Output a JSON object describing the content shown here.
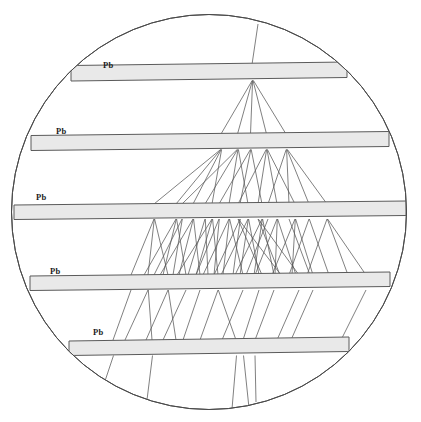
{
  "figure": {
    "kind": "cloud-chamber-cascade-shower",
    "background_color": "#ffffff"
  },
  "chamber": {
    "shape": "circle",
    "center_x": 209,
    "center_y": 212,
    "radius": 197.5,
    "outline_color": "#4a4a4a",
    "outline_width": 1.0,
    "fill_color": "#ffffff"
  },
  "style": {
    "plate_fill": "#e9e9e9",
    "plate_edge": "#5a5a5a",
    "plate_edge_width": 1.0,
    "track_color": "#555555",
    "track_width": 0.75,
    "label_color": "#1c1c1c"
  },
  "plates": [
    {
      "id": "plate-1",
      "label": "Pb",
      "label_x": 103,
      "label_y": 68,
      "x_left": 71,
      "x_right": 347,
      "y_left_top": 65.5,
      "y_right_top": 62.0,
      "thickness": 15.5
    },
    {
      "id": "plate-2",
      "label": "Pb",
      "label_x": 56,
      "label_y": 134,
      "x_left": 31,
      "x_right": 389,
      "y_left_top": 135.5,
      "y_right_top": 131.5,
      "thickness": 15.0
    },
    {
      "id": "plate-3",
      "label": "Pb",
      "label_x": 36,
      "label_y": 200,
      "x_left": 14,
      "x_right": 406,
      "y_left_top": 205.0,
      "y_right_top": 201.0,
      "thickness": 14.5
    },
    {
      "id": "plate-4",
      "label": "Pb",
      "label_x": 50,
      "label_y": 274,
      "x_left": 30,
      "x_right": 390,
      "y_left_top": 276.0,
      "y_right_top": 272.0,
      "thickness": 14.5
    },
    {
      "id": "plate-5",
      "label": "Pb",
      "label_x": 93,
      "label_y": 335,
      "x_left": 69,
      "x_right": 349,
      "y_left_top": 341.0,
      "y_right_top": 337.0,
      "thickness": 14.5
    }
  ],
  "chart_data": {
    "type": "scatter",
    "xlabel": "",
    "ylabel": "",
    "grid": false,
    "legend": null,
    "plate_labels": [
      "Pb",
      "Pb",
      "Pb",
      "Pb",
      "Pb"
    ],
    "gap_track_counts": [
      1,
      5,
      19,
      46,
      15,
      5
    ],
    "gap_names": [
      "above-plate-1",
      "plate-1-to-plate-2",
      "plate-2-to-plate-3",
      "plate-3-to-plate-4",
      "plate-4-to-plate-5",
      "below-plate-5"
    ],
    "tracks": {
      "gap0": [
        [
          258.0,
          24.0,
          252.0,
          64.5
        ]
      ],
      "gap1": [
        [
          252.2,
          80.5,
          221.0,
          134.0
        ],
        [
          252.4,
          80.5,
          237.5,
          134.0
        ],
        [
          252.6,
          80.5,
          250.5,
          134.0
        ],
        [
          253.0,
          80.5,
          266.5,
          134.0
        ],
        [
          253.4,
          80.5,
          286.0,
          134.0
        ]
      ],
      "gap2": [
        [
          220.6,
          149.5,
          154.0,
          204.0
        ],
        [
          220.8,
          149.5,
          176.0,
          204.0
        ],
        [
          221.2,
          149.5,
          193.0,
          204.0
        ],
        [
          221.6,
          149.5,
          212.0,
          204.0
        ],
        [
          237.2,
          149.5,
          182.0,
          204.0
        ],
        [
          237.6,
          149.5,
          205.0,
          204.0
        ],
        [
          238.0,
          149.5,
          229.0,
          204.0
        ],
        [
          238.4,
          149.5,
          248.0,
          204.0
        ],
        [
          250.4,
          149.5,
          219.0,
          204.0
        ],
        [
          250.8,
          149.5,
          240.0,
          204.0
        ],
        [
          251.2,
          149.5,
          262.0,
          204.0
        ],
        [
          266.2,
          149.5,
          238.0,
          204.0
        ],
        [
          266.6,
          149.5,
          258.0,
          204.0
        ],
        [
          267.0,
          149.5,
          277.0,
          204.0
        ],
        [
          267.4,
          149.5,
          295.0,
          204.0
        ],
        [
          286.2,
          149.5,
          268.0,
          204.0
        ],
        [
          286.6,
          149.5,
          289.0,
          204.0
        ],
        [
          287.0,
          149.5,
          309.0,
          204.0
        ],
        [
          287.4,
          149.5,
          327.0,
          204.0
        ]
      ],
      "gap3": [
        [
          154.0,
          219.0,
          131.0,
          275.0
        ],
        [
          154.3,
          219.0,
          148.0,
          275.0
        ],
        [
          154.6,
          219.0,
          168.0,
          275.0
        ],
        [
          176.0,
          219.0,
          144.0,
          275.0
        ],
        [
          176.3,
          219.0,
          163.0,
          275.0
        ],
        [
          176.6,
          219.0,
          186.0,
          275.0
        ],
        [
          193.0,
          219.0,
          160.0,
          275.0
        ],
        [
          193.3,
          219.0,
          179.0,
          275.0
        ],
        [
          193.6,
          219.0,
          200.0,
          275.0
        ],
        [
          212.0,
          219.0,
          177.0,
          275.0
        ],
        [
          212.3,
          219.0,
          196.0,
          275.0
        ],
        [
          212.6,
          219.0,
          218.0,
          275.0
        ],
        [
          182.0,
          219.0,
          154.0,
          275.0
        ],
        [
          182.3,
          219.0,
          173.0,
          275.0
        ],
        [
          205.0,
          219.0,
          188.0,
          275.0
        ],
        [
          205.3,
          219.0,
          208.0,
          275.0
        ],
        [
          229.0,
          219.0,
          203.0,
          275.0
        ],
        [
          229.3,
          219.0,
          223.0,
          275.0
        ],
        [
          229.6,
          219.0,
          243.0,
          275.0
        ],
        [
          248.0,
          219.0,
          221.0,
          275.0
        ],
        [
          248.3,
          219.0,
          240.0,
          275.0
        ],
        [
          248.6,
          219.0,
          259.0,
          275.0
        ],
        [
          219.0,
          219.0,
          196.0,
          275.0
        ],
        [
          219.3,
          219.0,
          214.0,
          275.0
        ],
        [
          240.0,
          219.0,
          214.0,
          275.0
        ],
        [
          240.3,
          219.0,
          233.0,
          275.0
        ],
        [
          262.0,
          219.0,
          235.0,
          275.0
        ],
        [
          262.3,
          219.0,
          254.0,
          275.0
        ],
        [
          262.6,
          219.0,
          274.0,
          275.0
        ],
        [
          238.0,
          219.0,
          262.0,
          275.0
        ],
        [
          238.3,
          219.0,
          281.0,
          275.0
        ],
        [
          258.0,
          219.0,
          280.0,
          275.0
        ],
        [
          258.3,
          219.0,
          299.0,
          275.0
        ],
        [
          277.0,
          219.0,
          255.0,
          275.0
        ],
        [
          277.3,
          219.0,
          275.0,
          275.0
        ],
        [
          277.6,
          219.0,
          296.0,
          275.0
        ],
        [
          295.0,
          219.0,
          272.0,
          275.0
        ],
        [
          295.3,
          219.0,
          292.0,
          275.0
        ],
        [
          295.6,
          219.0,
          313.0,
          275.0
        ],
        [
          268.0,
          219.0,
          246.0,
          275.0
        ],
        [
          289.0,
          219.0,
          310.0,
          275.0
        ],
        [
          309.0,
          219.0,
          289.0,
          275.0
        ],
        [
          309.3,
          219.0,
          329.0,
          275.0
        ],
        [
          327.0,
          219.0,
          307.0,
          275.0
        ],
        [
          327.3,
          219.0,
          348.0,
          275.0
        ],
        [
          327.6,
          219.0,
          366.0,
          275.0
        ]
      ],
      "gap4": [
        [
          131.0,
          290.0,
          113.0,
          340.0
        ],
        [
          148.0,
          290.0,
          125.0,
          340.0
        ],
        [
          148.3,
          290.0,
          152.0,
          340.0
        ],
        [
          168.0,
          290.0,
          146.0,
          340.0
        ],
        [
          168.3,
          290.0,
          176.0,
          340.0
        ],
        [
          186.0,
          290.0,
          163.0,
          340.0
        ],
        [
          200.0,
          290.0,
          183.0,
          340.0
        ],
        [
          218.0,
          290.0,
          200.0,
          340.0
        ],
        [
          218.3,
          290.0,
          236.0,
          340.0
        ],
        [
          243.0,
          290.0,
          222.0,
          340.0
        ],
        [
          259.0,
          290.0,
          243.0,
          340.0
        ],
        [
          274.0,
          290.0,
          255.0,
          340.0
        ],
        [
          299.0,
          290.0,
          277.0,
          340.0
        ],
        [
          313.0,
          290.0,
          291.0,
          340.0
        ],
        [
          366.0,
          290.0,
          341.0,
          340.0
        ]
      ],
      "gap5": [
        [
          113.5,
          355.5,
          104.0,
          384.0
        ],
        [
          152.5,
          355.5,
          146.0,
          408.0
        ],
        [
          236.5,
          355.5,
          232.0,
          409.0
        ],
        [
          243.5,
          355.5,
          249.0,
          408.0
        ],
        [
          255.0,
          355.5,
          256.0,
          402.0
        ]
      ]
    }
  }
}
